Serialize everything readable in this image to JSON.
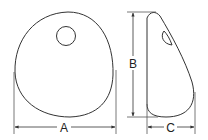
{
  "diagram": {
    "type": "technical-dimension-drawing",
    "views": [
      {
        "name": "front-view",
        "shape": "rounded disc with hole"
      },
      {
        "name": "side-view",
        "shape": "teardrop profile"
      }
    ],
    "dimensions": {
      "a": {
        "label": "A",
        "orientation": "horizontal",
        "describes": "width of front view"
      },
      "b": {
        "label": "B",
        "orientation": "vertical",
        "describes": "height of side view"
      },
      "c": {
        "label": "C",
        "orientation": "horizontal",
        "describes": "depth of side view"
      }
    },
    "colors": {
      "line": "#333333",
      "background": "#ffffff"
    }
  }
}
